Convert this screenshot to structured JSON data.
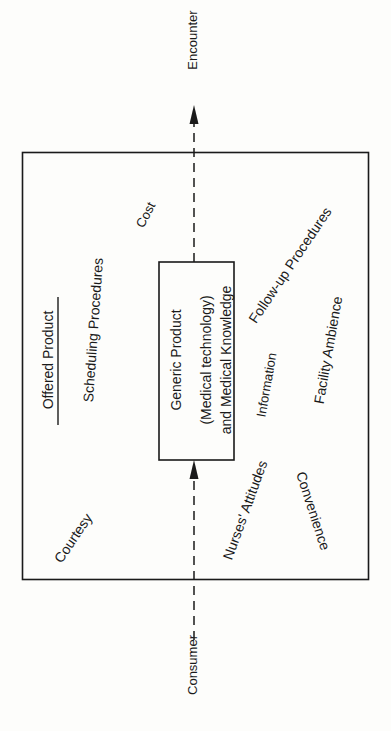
{
  "diagram": {
    "flow": {
      "start_label": "Consumer",
      "end_label": "Encounter"
    },
    "outer_box": {
      "title": "Offered Product",
      "attributes": [
        "Scheduling Procedures",
        "Cost",
        "Follow-up Procedures",
        "Information",
        "Facility Ambience",
        "Courtesy",
        "Nurses' Attitudes",
        "Convenience"
      ]
    },
    "inner_box": {
      "line1": "Generic Product",
      "line2": "(Medical technology)",
      "line3": "and Medical Knowledge"
    },
    "colors": {
      "line": "#1a1a1a",
      "background": "#fdfdfb"
    }
  }
}
